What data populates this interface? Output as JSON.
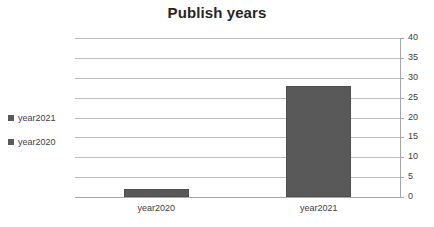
{
  "chart_data": {
    "type": "bar",
    "title": "Publish years",
    "xlabel": "",
    "ylabel": "",
    "categories": [
      "year2020",
      "year2021"
    ],
    "values": [
      2,
      28
    ],
    "series": [
      {
        "name": "Publish years",
        "values": [
          2,
          28
        ]
      }
    ],
    "ylim": [
      0,
      40
    ],
    "ytick_step": 5,
    "yticks": [
      0,
      5,
      10,
      15,
      20,
      25,
      30,
      35,
      40
    ],
    "ytick_labels": [
      "0",
      "5",
      "10",
      "15",
      "20",
      "25",
      "30",
      "35",
      "40"
    ],
    "y_axis_position": "right",
    "grid": true,
    "legend_position": "left",
    "legend": [
      "year2021",
      "year2020"
    ],
    "colors": {
      "bar_fill": "#595959",
      "bar_border": "#4d4d4d",
      "gridline": "#bfbfbf",
      "axis": "#a6a6a6",
      "title_text": "#262626",
      "label_text": "#404040",
      "background": "#ffffff"
    }
  },
  "legend_items": [
    {
      "label": "year2021",
      "color": "#595959"
    },
    {
      "label": "year2020",
      "color": "#595959"
    }
  ]
}
